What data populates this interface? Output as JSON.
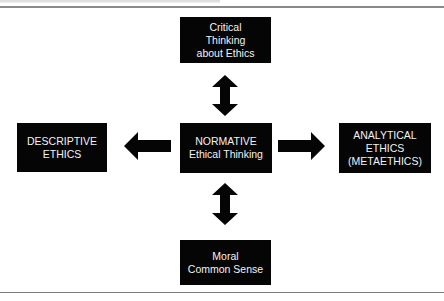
{
  "diagram": {
    "type": "concept-map",
    "colors": {
      "box_fill": "#050505",
      "box_text": "#f2f2f2",
      "arrow": "#050505",
      "rule": "#7d7d7d",
      "background": "#ffffff"
    },
    "nodes": {
      "top": {
        "lines": [
          "Critical",
          "Thinking",
          "about Ethics"
        ]
      },
      "left": {
        "lines": [
          "DESCRIPTIVE",
          "ETHICS"
        ]
      },
      "center": {
        "lines": [
          "NORMATIVE",
          "Ethical Thinking"
        ]
      },
      "right": {
        "lines": [
          "ANALYTICAL",
          "ETHICS",
          "(METAETHICS)"
        ]
      },
      "bottom": {
        "lines": [
          "Moral",
          "Common Sense"
        ]
      }
    },
    "edges": [
      {
        "from": "center",
        "to": "top",
        "direction": "bidirectional",
        "icon": "double-arrow-vertical"
      },
      {
        "from": "center",
        "to": "left",
        "direction": "one-way",
        "icon": "arrow-left"
      },
      {
        "from": "center",
        "to": "right",
        "direction": "one-way",
        "icon": "arrow-right"
      },
      {
        "from": "center",
        "to": "bottom",
        "direction": "bidirectional",
        "icon": "double-arrow-vertical"
      }
    ]
  }
}
